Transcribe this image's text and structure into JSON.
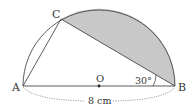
{
  "diagram": {
    "labels": {
      "A": "A",
      "B": "B",
      "C": "C",
      "O": "O"
    },
    "angle_label": "30°",
    "length_label": "8 cm",
    "colors": {
      "shade": "#c8c8c8",
      "stroke": "#333333"
    }
  }
}
